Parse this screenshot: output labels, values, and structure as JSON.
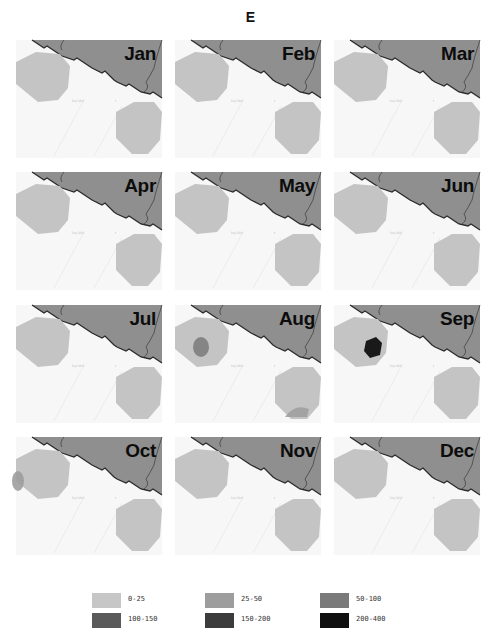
{
  "title": "E",
  "colors": {
    "land": "#8f8f8f",
    "water": "#f7f7f7",
    "coastline": "#2a2a2a",
    "octagon_base": "#c4c4c4"
  },
  "panels": [
    {
      "month": "Jan",
      "hotspots": []
    },
    {
      "month": "Feb",
      "hotspots": []
    },
    {
      "month": "Mar",
      "hotspots": []
    },
    {
      "month": "Apr",
      "hotspots": []
    },
    {
      "month": "May",
      "hotspots": []
    },
    {
      "month": "Jun",
      "hotspots": []
    },
    {
      "month": "Jul",
      "hotspots": []
    },
    {
      "month": "Aug",
      "hotspots": [
        {
          "area": "west-octagon",
          "class": "50-100"
        },
        {
          "area": "south-octagon",
          "class": "25-50"
        }
      ]
    },
    {
      "month": "Sep",
      "hotspots": [
        {
          "area": "west-octagon",
          "class": "200-400"
        }
      ]
    },
    {
      "month": "Oct",
      "hotspots": [
        {
          "area": "west-octagon-edge",
          "class": "25-50"
        }
      ]
    },
    {
      "month": "Nov",
      "hotspots": []
    },
    {
      "month": "Dec",
      "hotspots": []
    }
  ],
  "legend": {
    "items": [
      {
        "label": "0-25",
        "color": "#c6c6c6"
      },
      {
        "label": "25-50",
        "color": "#9d9d9d"
      },
      {
        "label": "50-100",
        "color": "#7a7a7a"
      },
      {
        "label": "100-150",
        "color": "#5a5a5a"
      },
      {
        "label": "150-200",
        "color": "#3c3c3c"
      },
      {
        "label": "200-400",
        "color": "#101010"
      }
    ]
  }
}
